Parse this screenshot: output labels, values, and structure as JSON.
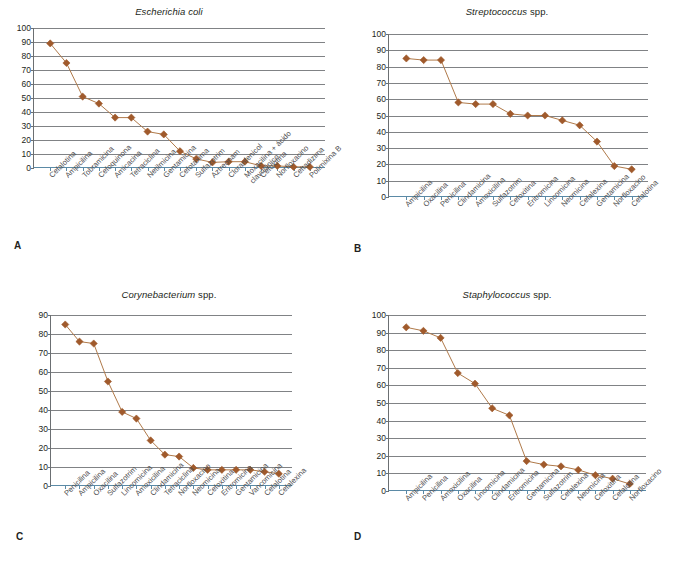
{
  "figure": {
    "panels": [
      {
        "letter": "A",
        "title_genus": "Escherichia coli",
        "title_suffix": "",
        "chart_data": {
          "type": "line",
          "title": "Escherichia coli",
          "xlabel": "",
          "ylabel": "",
          "ylim": [
            0,
            100
          ],
          "ytick_step": 10,
          "yticks": [
            0,
            10,
            20,
            30,
            40,
            50,
            60,
            70,
            80,
            90,
            100
          ],
          "grid": true,
          "legend": "none",
          "marker": "diamond",
          "categories": [
            "Cefalotina",
            "Ampicilina",
            "Tobramicina",
            "Cefoquinona",
            "Amicacina",
            "Tetraciclina",
            "Netilmicina",
            "Gentamicina",
            "Cefotaxima",
            "Sulfazotrim",
            "Aztreonam",
            "Cloranfenicol",
            "Moxacilina + ácido clavulânico",
            "Cefoxitina",
            "Norfloxacino",
            "Ceftadizima",
            "Polimixina B"
          ],
          "values": [
            89,
            75,
            51,
            46,
            36,
            36,
            26,
            24,
            12,
            6.5,
            4,
            4.5,
            4.5,
            1.5,
            1.5,
            0.8,
            0.8
          ]
        }
      },
      {
        "letter": "B",
        "title_genus": "Streptococcus",
        "title_suffix": " spp.",
        "chart_data": {
          "type": "line",
          "title": "Streptococcus spp.",
          "xlabel": "",
          "ylabel": "",
          "ylim": [
            0,
            100
          ],
          "ytick_step": 10,
          "yticks": [
            0,
            10,
            20,
            30,
            40,
            50,
            60,
            70,
            80,
            90,
            100
          ],
          "grid": true,
          "legend": "none",
          "marker": "diamond",
          "categories": [
            "Ampicilina",
            "Oxacilina",
            "Penicilina",
            "Clindamicina",
            "Amoxicilina",
            "Sulfazotrim",
            "Cefoxitina",
            "Eritromicina",
            "Lincomicina",
            "Neomicina",
            "Cefalexina",
            "Gentamicina",
            "Norfloxacino",
            "Cefalotina"
          ],
          "values": [
            85,
            84,
            84,
            58,
            57,
            57,
            51,
            50,
            50,
            47,
            44,
            34,
            19,
            17
          ]
        }
      },
      {
        "letter": "C",
        "title_genus": "Corynebacterium",
        "title_suffix": " spp.",
        "chart_data": {
          "type": "line",
          "title": "Corynebacterium spp.",
          "xlabel": "",
          "ylabel": "",
          "ylim": [
            0,
            90
          ],
          "ytick_step": 10,
          "yticks": [
            0,
            10,
            20,
            30,
            40,
            50,
            60,
            70,
            80,
            90
          ],
          "grid": true,
          "legend": "none",
          "marker": "diamond",
          "categories": [
            "Penicilina",
            "Ampicilina",
            "Oxacilina",
            "Sulfazotrim",
            "Lincomicina",
            "Amoxicilina",
            "Clindamicina",
            "Tetraciclina",
            "Norfloxacino",
            "Neomicina",
            "Cefoxitina",
            "Eritromicina",
            "Gentamicina",
            "Vancomicina",
            "Cefalotina",
            "Cefalexina"
          ],
          "values": [
            85,
            76,
            75,
            55,
            39,
            35.5,
            24,
            16.5,
            15.5,
            9.5,
            8.5,
            8.5,
            8.5,
            8.5,
            7.5,
            6.5
          ]
        }
      },
      {
        "letter": "D",
        "title_genus": "Staphylococcus",
        "title_suffix": " spp.",
        "chart_data": {
          "type": "line",
          "title": "Staphylococcus spp.",
          "xlabel": "",
          "ylabel": "",
          "ylim": [
            0,
            100
          ],
          "ytick_step": 10,
          "yticks": [
            0,
            10,
            20,
            30,
            40,
            50,
            60,
            70,
            80,
            90,
            100
          ],
          "grid": true,
          "legend": "none",
          "marker": "diamond",
          "categories": [
            "Ampicilina",
            "Penicilina",
            "Amoxicilina",
            "Oxacilina",
            "Lincomicina",
            "Clindamicina",
            "Eritromicina",
            "Gentamicina",
            "Sulfazotrim",
            "Cefalexina",
            "Neomicina",
            "Cefoxitina",
            "Cefalotina",
            "Norfloxacino"
          ],
          "values": [
            93,
            91,
            87,
            67,
            61,
            47,
            43,
            17,
            15,
            14,
            12,
            9,
            7,
            4
          ]
        }
      }
    ],
    "colors": {
      "marker": "#a05a2c",
      "line": "#b07a4a",
      "grid": "#808285",
      "axis": "#5b8aa6",
      "text": "#231f20"
    }
  }
}
